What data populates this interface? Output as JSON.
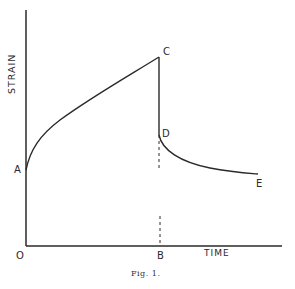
{
  "figure": {
    "caption": "Fig. 1.",
    "y_axis_label": "STRAIN",
    "x_axis_label": "TIME",
    "origin_label": "O",
    "points": {
      "A": "A",
      "B": "B",
      "C": "C",
      "D": "D",
      "E": "E"
    },
    "colors": {
      "line": "#2a2a2a",
      "background": "#ffffff"
    }
  }
}
